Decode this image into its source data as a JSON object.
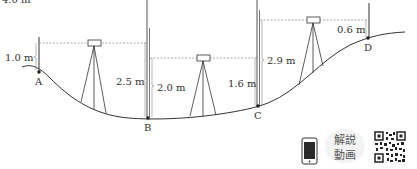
{
  "top_cut_text": "4.0 m",
  "points": [
    {
      "name": "A",
      "x": 39,
      "y": 72
    },
    {
      "name": "B",
      "x": 148,
      "y": 118
    },
    {
      "name": "C",
      "x": 258,
      "y": 106
    },
    {
      "name": "D",
      "x": 368,
      "y": 38
    }
  ],
  "measurements": {
    "a_backsight": "1.0 m",
    "b_foresight": "2.5 m",
    "b_backsight": "2.0 m",
    "c_foresight": "1.6 m",
    "c_backsight": "2.9 m",
    "d_foresight": "0.6 m"
  },
  "labels": {
    "point_a": "A",
    "point_b": "B",
    "point_c": "C",
    "point_d": "D"
  },
  "video_badge": {
    "line1": "解説",
    "line2": "動画"
  },
  "colors": {
    "line": "#333333",
    "dashed": "#888888",
    "rod": "#555555"
  }
}
